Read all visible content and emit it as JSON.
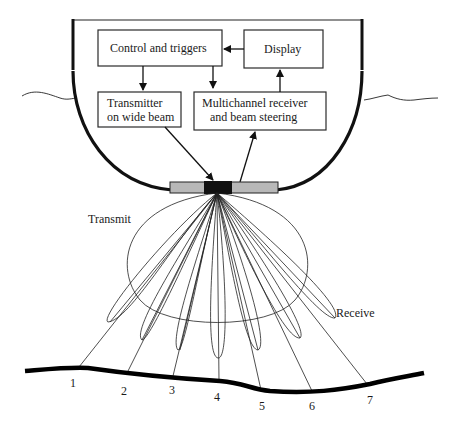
{
  "diagram": {
    "boxes": {
      "control": "Control and triggers",
      "display": "Display",
      "transmitter_line1": "Transmitter",
      "transmitter_line2": "on wide beam",
      "receiver_line1": "Multichannel receiver",
      "receiver_line2": "and beam steering"
    },
    "labels": {
      "transmit": "Transmit",
      "receive": "Receive"
    },
    "seafloor_points": [
      "1",
      "2",
      "3",
      "4",
      "5",
      "6",
      "7"
    ],
    "colors": {
      "line": "#222222",
      "transducer_outer": "#b8b8b8",
      "transducer_center": "#111111"
    },
    "connections": [
      {
        "from": "Display",
        "to": "Control and triggers"
      },
      {
        "from": "Control and triggers",
        "to": "Transmitter on wide beam"
      },
      {
        "from": "Control and triggers",
        "to": "Multichannel receiver and beam steering"
      },
      {
        "from": "Multichannel receiver and beam steering",
        "to": "Display"
      },
      {
        "from": "Transmitter on wide beam",
        "to": "Transducer array"
      },
      {
        "from": "Transducer array",
        "to": "Multichannel receiver and beam steering"
      }
    ]
  }
}
